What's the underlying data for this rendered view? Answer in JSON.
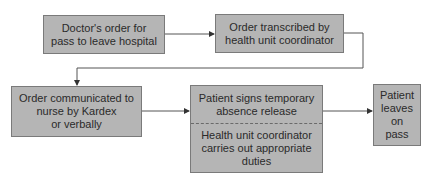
{
  "diagram": {
    "type": "flowchart",
    "colors": {
      "box_fill": "#b5b5b5",
      "box_border": "#7a7a7a",
      "line": "#555555",
      "text": "#2a2a2a"
    },
    "nodes": [
      {
        "id": "n1",
        "label": "Doctor's order for\npass to leave hospital"
      },
      {
        "id": "n2",
        "label": "Order transcribed by\nhealth unit coordinator"
      },
      {
        "id": "n3",
        "label": "Order communicated to\nnurse by Kardex\nor verbally"
      },
      {
        "id": "n4",
        "label_top": "Patient signs temporary\nabsence release",
        "label_bottom": "Health unit coordinator\ncarries out appropriate\nduties"
      },
      {
        "id": "n5",
        "label": "Patient\nleaves\non\npass"
      }
    ],
    "edges": [
      {
        "from": "n1",
        "to": "n2"
      },
      {
        "from": "n2",
        "to": "n3"
      },
      {
        "from": "n3",
        "to": "n4"
      },
      {
        "from": "n4",
        "to": "n5"
      }
    ]
  }
}
